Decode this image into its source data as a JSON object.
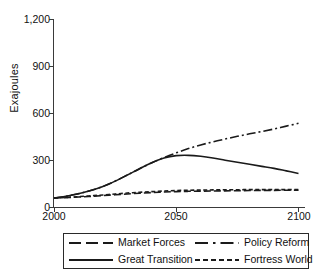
{
  "chart_data": {
    "type": "line",
    "title": "",
    "xlabel": "",
    "ylabel": "Exajoules",
    "xlim": [
      2000,
      2100
    ],
    "ylim": [
      0,
      1200
    ],
    "xticks": [
      "2000",
      "2050",
      "2100"
    ],
    "yticks": [
      "0",
      "300",
      "600",
      "900",
      "1,200"
    ],
    "grid": false,
    "legend_position": "below",
    "x": [
      2000,
      2005,
      2010,
      2015,
      2020,
      2025,
      2030,
      2035,
      2040,
      2045,
      2050,
      2055,
      2060,
      2065,
      2070,
      2075,
      2080,
      2085,
      2090,
      2095,
      2100
    ],
    "series": [
      {
        "name": "Market Forces",
        "style": "long-dash",
        "values": [
          60,
          63,
          67,
          71,
          76,
          81,
          86,
          91,
          95,
          99,
          101,
          103,
          104,
          105,
          106,
          107,
          108,
          109,
          109,
          110,
          110
        ]
      },
      {
        "name": "Policy Reform",
        "style": "dash-dot",
        "values": [
          60,
          72,
          88,
          108,
          134,
          168,
          207,
          247,
          285,
          318,
          348,
          375,
          398,
          418,
          436,
          453,
          469,
          484,
          500,
          518,
          536
        ]
      },
      {
        "name": "Great Transition",
        "style": "solid",
        "values": [
          60,
          72,
          88,
          108,
          134,
          168,
          207,
          247,
          285,
          315,
          330,
          332,
          326,
          315,
          301,
          288,
          275,
          262,
          249,
          233,
          217
        ]
      },
      {
        "name": "Fortress World",
        "style": "short-dash",
        "values": [
          60,
          64,
          69,
          74,
          80,
          86,
          92,
          97,
          101,
          105,
          108,
          110,
          111,
          112,
          113,
          113,
          114,
          114,
          114,
          114,
          114
        ]
      }
    ]
  },
  "axis": {
    "ylabel": "Exajoules",
    "yticks": [
      "1,200",
      "900",
      "600",
      "300",
      "0"
    ],
    "xticks": [
      "2000",
      "2050",
      "2100"
    ]
  },
  "legend": {
    "items": [
      {
        "label": "Market Forces",
        "style": "long-dash"
      },
      {
        "label": "Policy Reform",
        "style": "dash-dot"
      },
      {
        "label": "Great Transition",
        "style": "solid"
      },
      {
        "label": "Fortress World",
        "style": "short-dash"
      }
    ]
  },
  "colors": {
    "line": "#1a1a1a",
    "axis": "#3a3a3a",
    "text": "#111111",
    "background": "#ffffff"
  }
}
